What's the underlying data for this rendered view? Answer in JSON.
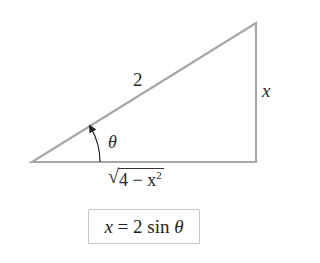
{
  "diagram": {
    "type": "right-triangle",
    "line_color": "#a8a8a8",
    "vertices": {
      "left": [
        32,
        162
      ],
      "top_right": [
        256,
        23
      ],
      "bottom_right": [
        256,
        162
      ]
    },
    "labels": {
      "hypotenuse": "2",
      "opposite": "x",
      "angle": "θ",
      "adjacent_sqrt_base": "4 − x",
      "adjacent_exponent": "2"
    },
    "formula": {
      "var": "x",
      "equals": " = 2 sin ",
      "angle": "θ"
    }
  }
}
